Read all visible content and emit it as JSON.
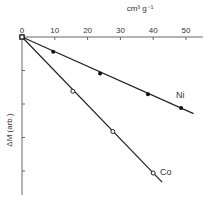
{
  "chart_data": {
    "type": "line",
    "title": "",
    "xlabel": "cm³ g⁻¹",
    "ylabel": "ΔM (arb.)",
    "xlim": [
      0,
      55
    ],
    "ylim": [
      -4.7,
      0
    ],
    "x_ticks": [
      0,
      10,
      20,
      30,
      40,
      50
    ],
    "x_tick_labels": [
      "0",
      "10",
      "20",
      "30",
      "40",
      "50"
    ],
    "y_ticks": [
      -1,
      -2,
      -3,
      -4
    ],
    "y_tick_labels": [
      "",
      "",
      "",
      ""
    ],
    "x_axis_position": "top",
    "grid": false,
    "legend": "inline labels",
    "series": [
      {
        "name": "Ni",
        "marker": "filled-circle",
        "x": [
          0,
          9.5,
          23.8,
          38.4,
          48.5
        ],
        "y": [
          0,
          -0.44,
          -1.09,
          -1.71,
          -2.12
        ],
        "line_extend_to_x": 52.3
      },
      {
        "name": "Co",
        "marker": "open-circle",
        "x": [
          0,
          15.5,
          27.7,
          40.0
        ],
        "y": [
          0,
          -1.62,
          -2.82,
          -4.06
        ],
        "line_extend_to_x": 42.7
      }
    ]
  }
}
